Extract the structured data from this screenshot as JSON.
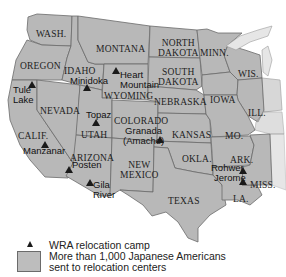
{
  "map": {
    "states": [
      {
        "id": "wash",
        "label": "WASH."
      },
      {
        "id": "oregon",
        "label": "OREGON"
      },
      {
        "id": "calif",
        "label": "CALIF."
      },
      {
        "id": "nevada",
        "label": "NEVADA"
      },
      {
        "id": "idaho",
        "label": "IDAHO"
      },
      {
        "id": "montana",
        "label": "MONTANA"
      },
      {
        "id": "wyoming",
        "label": "WYOMING"
      },
      {
        "id": "utah",
        "label": "UTAH"
      },
      {
        "id": "arizona",
        "label": "ARIZONA"
      },
      {
        "id": "colorado",
        "label": "COLORADO"
      },
      {
        "id": "new_mexico",
        "label": "NEW\nMEXICO"
      },
      {
        "id": "north_dakota",
        "label": "NORTH\nDAKOTA"
      },
      {
        "id": "south_dakota",
        "label": "SOUTH\nDAKOTA"
      },
      {
        "id": "nebraska",
        "label": "NEBRASKA"
      },
      {
        "id": "kansas",
        "label": "KANSAS"
      },
      {
        "id": "okla",
        "label": "OKLA."
      },
      {
        "id": "texas",
        "label": "TEXAS"
      },
      {
        "id": "minn",
        "label": "MINN."
      },
      {
        "id": "iowa",
        "label": "IOWA"
      },
      {
        "id": "mo",
        "label": "MO."
      },
      {
        "id": "ark",
        "label": "ARK."
      },
      {
        "id": "la",
        "label": "LA."
      },
      {
        "id": "wis",
        "label": "WIS."
      },
      {
        "id": "ill",
        "label": "ILL."
      },
      {
        "id": "miss",
        "label": "MISS."
      }
    ],
    "camps": [
      {
        "name": "Tule Lake"
      },
      {
        "name": "Minidoka"
      },
      {
        "name": "Heart Mountain"
      },
      {
        "name": "Topaz"
      },
      {
        "name": "Manzanar"
      },
      {
        "name": "Granada (Amache)"
      },
      {
        "name": "Posten"
      },
      {
        "name": "Gila River"
      },
      {
        "name": "Rohwer"
      },
      {
        "name": "Jerome"
      }
    ],
    "colors": {
      "state_fill": "#b8b8b8",
      "state_border": "#6b6b6b",
      "camp_marker": "#1a1a1a",
      "background": "#ffffff"
    }
  },
  "legend": {
    "camp_label": "WRA relocation camp",
    "area_label_line1": "More than 1,000 Japanese Americans",
    "area_label_line2": "sent to relocation centers"
  }
}
